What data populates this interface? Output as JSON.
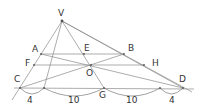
{
  "diagram": {
    "type": "geometry-perspective-figure",
    "colors": {
      "line": "#8a8a8a",
      "text": "#333333",
      "background": "#ffffff"
    },
    "points": {
      "V": {
        "label": "V",
        "x": 62,
        "y": 21,
        "lx": 58,
        "ly": 16
      },
      "A": {
        "label": "A",
        "x": 41,
        "y": 54,
        "lx": 32,
        "ly": 52
      },
      "E": {
        "label": "E",
        "x": 84,
        "y": 54,
        "lx": 84,
        "ly": 51
      },
      "B": {
        "label": "B",
        "x": 124,
        "y": 54,
        "lx": 128,
        "ly": 51
      },
      "F": {
        "label": "F",
        "x": 34,
        "y": 65,
        "lx": 25,
        "ly": 66
      },
      "O": {
        "label": "O",
        "x": 91,
        "y": 65,
        "lx": 86,
        "ly": 76
      },
      "H": {
        "label": "H",
        "x": 144,
        "y": 65,
        "lx": 152,
        "ly": 66
      },
      "C": {
        "label": "C",
        "x": 20,
        "y": 88,
        "lx": 14,
        "ly": 82
      },
      "G": {
        "label": "G",
        "x": 104,
        "y": 88,
        "lx": 99,
        "ly": 98
      },
      "D": {
        "label": "D",
        "x": 183,
        "y": 88,
        "lx": 179,
        "ly": 82
      }
    },
    "segments_on_base": [
      {
        "label": "4",
        "from_x": 20,
        "to_x": 44,
        "lx": 28,
        "ly": 102
      },
      {
        "label": "10",
        "from_x": 44,
        "to_x": 104,
        "lx": 68,
        "ly": 102
      },
      {
        "label": "10",
        "from_x": 104,
        "to_x": 160,
        "lx": 126,
        "ly": 102
      },
      {
        "label": "4",
        "from_x": 160,
        "to_x": 183,
        "lx": 170,
        "ly": 102
      }
    ]
  }
}
